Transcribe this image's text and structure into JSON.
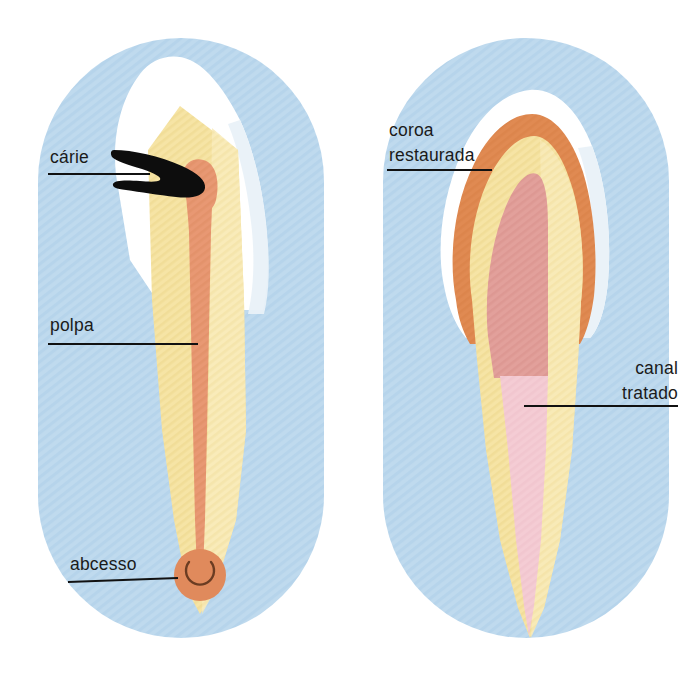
{
  "figure": {
    "language": "pt-BR",
    "panel_count": 2,
    "background_color": "#ffffff",
    "panel_fill_color": "#bed9ee",
    "panel_shape": "stadium"
  },
  "palette": {
    "background": "#ffffff",
    "panel_blue": "#bed9ee",
    "panel_blue_stripe": "#aed0e8",
    "enamel_white": "#fdfdfd",
    "enamel_shadow": "#eef4f9",
    "dentin_yellow": "#f4e09a",
    "dentin_yellow_light": "#f8ebb8",
    "pulp_salmon": "#e89873",
    "pulp_salmon_dark": "#e08a5c",
    "caries_black": "#0d0d0d",
    "abscess_orange": "#e08a5c",
    "abscess_arc": "#6b3c22",
    "crown_orange": "#e08a52",
    "filling_rose": "#e2a09b",
    "canal_pink": "#f4ccd4",
    "label_text": "#1a1a1a",
    "leader_line": "#111111"
  },
  "panels": [
    {
      "id": "left-panel",
      "name": "dente-cariado",
      "labels": [
        {
          "key": "carie",
          "text": "cárie",
          "lines": [
            "cárie"
          ],
          "x": 50,
          "y": 163,
          "align": "left",
          "underline": {
            "x1": 48,
            "x2": 142,
            "y": 174
          },
          "leader": {
            "x1": 96,
            "y1": 174,
            "x2": 150,
            "y2": 174
          }
        },
        {
          "key": "polpa",
          "text": "polpa",
          "lines": [
            "polpa"
          ],
          "x": 50,
          "y": 331,
          "align": "left",
          "underline": {
            "x1": 48,
            "x2": 190,
            "y": 344
          },
          "leader": {
            "x1": 48,
            "y1": 344,
            "x2": 190,
            "y2": 344
          }
        },
        {
          "key": "abcesso",
          "text": "abcesso",
          "lines": [
            "abcesso"
          ],
          "x": 70,
          "y": 570,
          "align": "left",
          "underline": {
            "x1": 68,
            "x2": 172,
            "y": 582
          },
          "leader": {
            "x1": 68,
            "y1": 582,
            "x2": 176,
            "y2": 578
          }
        }
      ],
      "structures": [
        {
          "key": "enamel",
          "name": "esmalte",
          "color": "#fdfdfd"
        },
        {
          "key": "dentin",
          "name": "dentina",
          "color": "#f4e09a"
        },
        {
          "key": "pulp",
          "name": "polpa",
          "color": "#e89873"
        },
        {
          "key": "caries",
          "name": "cárie",
          "color": "#0d0d0d"
        },
        {
          "key": "abscess",
          "name": "abcesso",
          "color": "#e08a5c"
        }
      ]
    },
    {
      "id": "right-panel",
      "name": "dente-tratado",
      "labels": [
        {
          "key": "coroa_restaurada",
          "text": "coroa restaurada",
          "lines": [
            "coroa",
            "restaurada"
          ],
          "x": 389,
          "y": 136,
          "align": "left",
          "underline": {
            "x1": 387,
            "x2": 478,
            "y": 170
          },
          "leader": {
            "x1": 387,
            "y1": 170,
            "x2": 486,
            "y2": 170
          }
        },
        {
          "key": "canal_tratado",
          "text": "canal tratado",
          "lines": [
            "canal",
            "tratado"
          ],
          "x": 678,
          "y": 374,
          "align": "right",
          "underline": {
            "x1": 588,
            "x2": 678,
            "y": 404
          },
          "leader": {
            "x1": 524,
            "y1": 404,
            "x2": 678,
            "y2": 404
          }
        }
      ],
      "structures": [
        {
          "key": "enamel_outline",
          "name": "contorno-do-esmalte",
          "color": "#fdfdfd"
        },
        {
          "key": "crown_restoration",
          "name": "coroa-restaurada",
          "color": "#e08a52"
        },
        {
          "key": "dentin",
          "name": "dentina",
          "color": "#f4e09a"
        },
        {
          "key": "filling",
          "name": "restauracao-interna",
          "color": "#e2a09b"
        },
        {
          "key": "treated_canal",
          "name": "canal-tratado",
          "color": "#f4ccd4"
        }
      ]
    }
  ]
}
